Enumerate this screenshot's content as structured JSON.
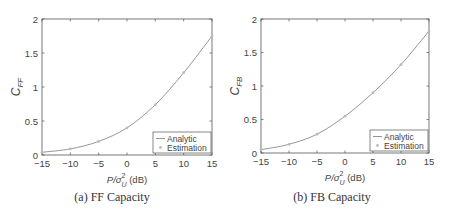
{
  "chart_data": [
    {
      "type": "line",
      "title": "",
      "caption": "(a) FF Capacity",
      "xlabel": "P/σ_U^2 (dB)",
      "ylabel": "C_FF",
      "xlim": [
        -15,
        15
      ],
      "ylim": [
        0,
        2
      ],
      "xticks": [
        -15,
        -10,
        -5,
        0,
        5,
        10,
        15
      ],
      "yticks": [
        0,
        0.5,
        1,
        1.5,
        2
      ],
      "ytick_labels": [
        "0",
        "0.5",
        "1",
        "1.5",
        "2"
      ],
      "grid": false,
      "legend_position": "lower right",
      "x": [
        -15,
        -10,
        -5,
        0,
        5,
        10,
        15
      ],
      "series": [
        {
          "name": "Analytic",
          "style": "line",
          "values": [
            0.04,
            0.09,
            0.2,
            0.4,
            0.74,
            1.21,
            1.75
          ]
        },
        {
          "name": "Estimation",
          "style": "markers",
          "values": [
            0.04,
            0.09,
            0.2,
            0.4,
            0.74,
            1.21,
            1.75
          ]
        }
      ]
    },
    {
      "type": "line",
      "title": "",
      "caption": "(b) FB Capacity",
      "xlabel": "P/σ_U^2 (dB)",
      "ylabel": "C_FB",
      "xlim": [
        -15,
        15
      ],
      "ylim": [
        0,
        2
      ],
      "xticks": [
        -15,
        -10,
        -5,
        0,
        5,
        10,
        15
      ],
      "yticks": [
        0,
        0.5,
        1,
        1.5,
        2
      ],
      "ytick_labels": [
        "0",
        "0.5",
        "1",
        "1.5",
        "2"
      ],
      "grid": false,
      "legend_position": "lower right",
      "x": [
        -15,
        -10,
        -5,
        0,
        5,
        10,
        15
      ],
      "series": [
        {
          "name": "Analytic",
          "style": "line",
          "values": [
            0.05,
            0.13,
            0.28,
            0.55,
            0.9,
            1.32,
            1.82
          ]
        },
        {
          "name": "Estimation",
          "style": "markers",
          "values": [
            0.05,
            0.13,
            0.28,
            0.55,
            0.9,
            1.32,
            1.82
          ]
        }
      ]
    }
  ],
  "panels": [
    {
      "caption": "(a) FF Capacity",
      "ylabel_main": "C",
      "ylabel_sub": "FF",
      "xlabel_main": "P/σ",
      "xlabel_sup": "2",
      "xlabel_sub": "U",
      "xlabel_unit": " (dB)",
      "legend": {
        "analytic": "Analytic",
        "estimation": "Estimation"
      }
    },
    {
      "caption": "(b) FB Capacity",
      "ylabel_main": "C",
      "ylabel_sub": "FB",
      "xlabel_main": "P/σ",
      "xlabel_sup": "2",
      "xlabel_sub": "U",
      "xlabel_unit": " (dB)",
      "legend": {
        "analytic": "Analytic",
        "estimation": "Estimation"
      }
    }
  ],
  "colors": {
    "axis": "#555555",
    "line": "#8a8a8a",
    "marker": "#bbbbbb",
    "text": "#444444"
  }
}
